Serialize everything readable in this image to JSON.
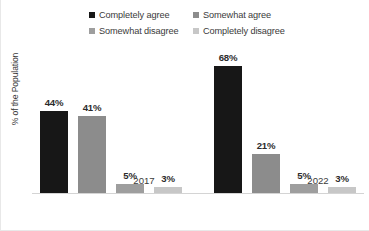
{
  "chart_data": {
    "type": "bar",
    "title": "",
    "subtitle": "",
    "xlabel": "",
    "ylabel": "% of the Population",
    "categories": [
      "2017",
      "2022"
    ],
    "ylim": [
      0,
      75
    ],
    "grid": false,
    "legend_position": "top",
    "value_suffix": "%",
    "series": [
      {
        "name": "Completely agree",
        "color": "#171717",
        "values": [
          44,
          68
        ],
        "labels": [
          "44%",
          "68%"
        ]
      },
      {
        "name": "Somewhat agree",
        "color": "#8c8c8c",
        "values": [
          41,
          21
        ],
        "labels": [
          "41%",
          "21%"
        ]
      },
      {
        "name": "Somewhat disagree",
        "color": "#9e9e9e",
        "values": [
          5,
          5
        ],
        "labels": [
          "5%",
          "5%"
        ]
      },
      {
        "name": "Completely disagree",
        "color": "#c7c7c7",
        "values": [
          3,
          3
        ],
        "labels": [
          "3%",
          "3%"
        ]
      }
    ]
  },
  "legend": {
    "rows": [
      [
        {
          "label": "Completely agree",
          "color": "#171717"
        },
        {
          "label": "Somewhat agree",
          "color": "#8c8c8c"
        }
      ],
      [
        {
          "label": "Somewhat disagree",
          "color": "#9e9e9e"
        },
        {
          "label": "Completely disagree",
          "color": "#c7c7c7"
        }
      ]
    ]
  },
  "axis": {
    "y_title": "% of the Population",
    "x_categories": [
      "2017",
      "2022"
    ]
  }
}
